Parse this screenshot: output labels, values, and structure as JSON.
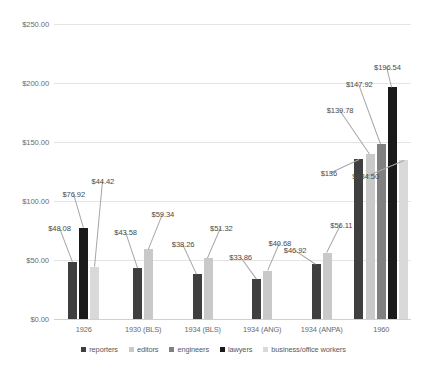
{
  "chart_data": {
    "type": "bar",
    "title": "",
    "xlabel": "",
    "ylabel": "",
    "ylim": [
      0,
      250
    ],
    "ytick_labels": [
      "$0.00",
      "$50.00",
      "$100.00",
      "$150.00",
      "$200.00",
      "$250.00"
    ],
    "ytick_values": [
      0,
      50,
      100,
      150,
      200,
      250
    ],
    "grid": true,
    "legend_position": "bottom",
    "categories": [
      "1926",
      "1930 (BLS)",
      "1934 (BLS)",
      "1934 (ANG)",
      "1934 (ANPA)",
      "1960"
    ],
    "series": [
      {
        "name": "reporters",
        "color": "#3f3f3f",
        "values": [
          48.08,
          43.58,
          38.26,
          33.86,
          46.92,
          136
        ]
      },
      {
        "name": "editors",
        "color": "#c9c9c9",
        "values": [
          null,
          59.34,
          51.32,
          40.68,
          56.11,
          139.78
        ]
      },
      {
        "name": "engineers",
        "color": "#808080",
        "values": [
          null,
          null,
          null,
          null,
          null,
          147.92
        ]
      },
      {
        "name": "lawyers",
        "color": "#1a1a1a",
        "values": [
          76.92,
          null,
          null,
          null,
          null,
          196.54
        ]
      },
      {
        "name": "business/office workers",
        "color": "#d9d9d9",
        "values": [
          44.42,
          null,
          null,
          null,
          null,
          134.5
        ]
      }
    ],
    "data_labels": [
      {
        "text": "$48.08",
        "series": "reporters",
        "category": "1926"
      },
      {
        "text": "$76.92",
        "series": "lawyers",
        "category": "1926"
      },
      {
        "text": "$44.42",
        "series": "business/office workers",
        "category": "1926"
      },
      {
        "text": "$43.58",
        "series": "reporters",
        "category": "1930 (BLS)"
      },
      {
        "text": "$59.34",
        "series": "editors",
        "category": "1930 (BLS)"
      },
      {
        "text": "$38.26",
        "series": "reporters",
        "category": "1934 (BLS)"
      },
      {
        "text": "$51.32",
        "series": "editors",
        "category": "1934 (BLS)"
      },
      {
        "text": "$33.86",
        "series": "reporters",
        "category": "1934 (ANG)"
      },
      {
        "text": "$40.68",
        "series": "editors",
        "category": "1934 (ANG)"
      },
      {
        "text": "$46.92",
        "series": "reporters",
        "category": "1934 (ANPA)"
      },
      {
        "text": "$56.11",
        "series": "editors",
        "category": "1934 (ANPA)"
      },
      {
        "text": "$136",
        "series": "reporters",
        "category": "1960"
      },
      {
        "text": "$139.78",
        "series": "editors",
        "category": "1960"
      },
      {
        "text": "$147.92",
        "series": "engineers",
        "category": "1960"
      },
      {
        "text": "$196.54",
        "series": "lawyers",
        "category": "1960"
      },
      {
        "text": "$134.50",
        "series": "business/office workers",
        "category": "1960"
      }
    ]
  },
  "legend": {
    "items": [
      {
        "label": "reporters",
        "color": "#3f3f3f"
      },
      {
        "label": "editors",
        "color": "#c9c9c9"
      },
      {
        "label": "engineers",
        "color": "#808080"
      },
      {
        "label": "lawyers",
        "color": "#1a1a1a"
      },
      {
        "label": "business/office workers",
        "color": "#d9d9d9"
      }
    ]
  }
}
